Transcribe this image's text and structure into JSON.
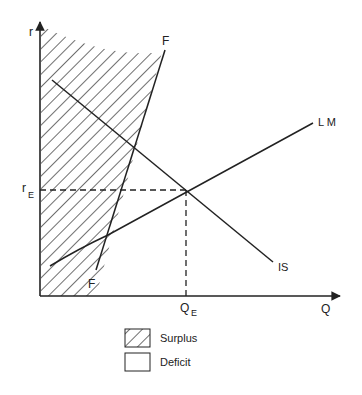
{
  "diagram": {
    "type": "IS-LM with balance-of-payments (FF) curve",
    "axes": {
      "y_label": "r",
      "x_label": "Q"
    },
    "curves": {
      "ff": {
        "label_top": "F",
        "label_bottom": "F"
      },
      "is": {
        "label": "IS"
      },
      "lm": {
        "label": "L M"
      }
    },
    "equilibrium": {
      "r_label": "r",
      "r_sub": "E",
      "q_label": "Q",
      "q_sub": "E"
    },
    "legend": {
      "items": [
        {
          "label": "Surplus",
          "pattern": "hatched"
        },
        {
          "label": "Deficit",
          "pattern": "blank"
        }
      ]
    },
    "colors": {
      "ink": "#222222",
      "background": "#ffffff"
    }
  }
}
